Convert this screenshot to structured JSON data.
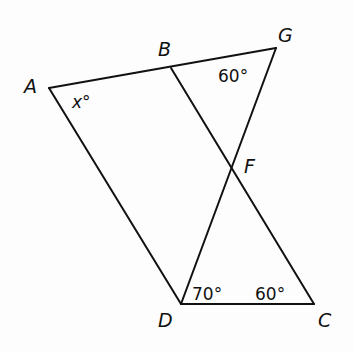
{
  "diagram": {
    "points": {
      "A": {
        "label": "A",
        "x": 49,
        "y": 88
      },
      "B": {
        "label": "B",
        "x": 171,
        "y": 68
      },
      "G": {
        "label": "G",
        "x": 276,
        "y": 48
      },
      "F": {
        "label": "F",
        "x": 232,
        "y": 166
      },
      "D": {
        "label": "D",
        "x": 181,
        "y": 304
      },
      "C": {
        "label": "C",
        "x": 314,
        "y": 304
      }
    },
    "segments": [
      "A-G",
      "A-D",
      "D-C",
      "B-C",
      "D-G"
    ],
    "angles": {
      "A": {
        "text": "x",
        "degree": "°"
      },
      "G": {
        "text": "60°"
      },
      "D": {
        "text": "70°"
      },
      "C": {
        "text": "60°"
      }
    },
    "stroke_color": "#111111"
  }
}
